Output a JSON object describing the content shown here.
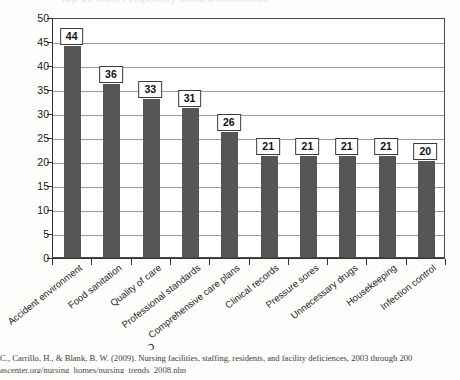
{
  "figure": {
    "title_ghost": "Top 10 Most Frequently Cited Deficiencies",
    "scan_artifact": "ↄ"
  },
  "caption": {
    "line1": "C., Carrillo, H., & Blank, B. W. (2009). Nursing facilities, staffing, residents, and facility deficiences, 2003 through 200",
    "line2": "ascenter.org/nursing_homes/nursing_trends_2008.php"
  },
  "chart_data": {
    "type": "bar",
    "title": "",
    "xlabel": "",
    "ylabel": "",
    "ylim": [
      0,
      50
    ],
    "grid": true,
    "legend": "none",
    "orientation": "vertical",
    "bar_color": "#565656",
    "categories": [
      "Accident environment",
      "Food sanitation",
      "Quality of care",
      "Professional standards",
      "Comprehensive care plans",
      "Clinical records",
      "Pressure sores",
      "Unnecessary drugs",
      "Housekeeping",
      "Infection control"
    ],
    "values": [
      44,
      36,
      33,
      31,
      26,
      21,
      21,
      21,
      21,
      20
    ],
    "data_labels": [
      "44",
      "36",
      "33",
      "31",
      "26",
      "21",
      "21",
      "21",
      "21",
      "20"
    ],
    "yticks": [
      0,
      5,
      10,
      15,
      20,
      25,
      30,
      35,
      40,
      45,
      50
    ],
    "ytick_labels": [
      "0",
      "5",
      "10",
      "15",
      "20",
      "25",
      "30",
      "35",
      "40",
      "45",
      "50"
    ]
  }
}
